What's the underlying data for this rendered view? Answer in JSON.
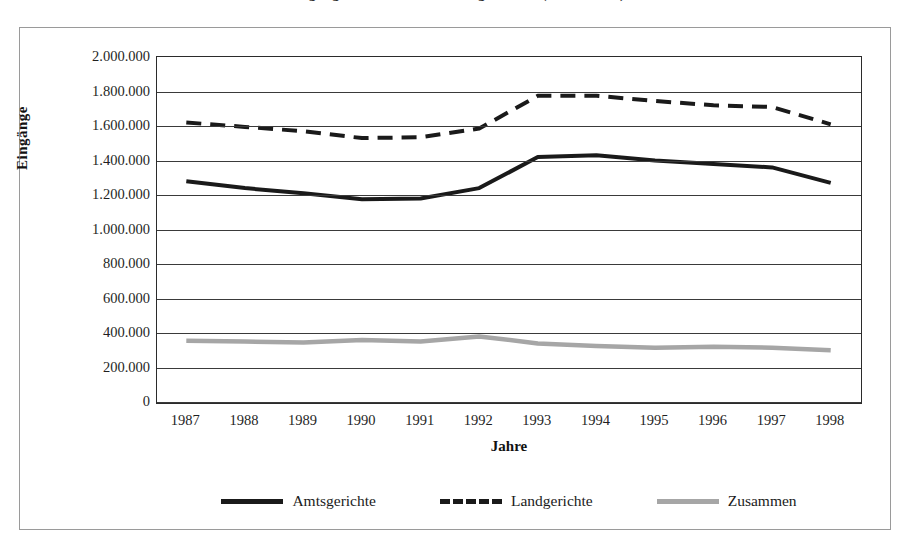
{
  "title": {
    "text": "Eingänge bei Amts- und Landgerichten (Zivilsachen)"
  },
  "axes": {
    "y_title": "Eingänge",
    "x_title": "Jahre",
    "y_ticks": [
      "2.000.000",
      "1.800.000",
      "1.600.000",
      "1.400.000",
      "1.200.000",
      "1.000.000",
      "800.000",
      "600.000",
      "400.000",
      "200.000",
      "0"
    ]
  },
  "legend": {
    "position": "bottom",
    "items": [
      {
        "label": "Amtsgerichte",
        "color": "#1a1a1a",
        "style": "solid"
      },
      {
        "label": "Landgerichte",
        "color": "#1a1a1a",
        "style": "dashed"
      },
      {
        "label": "Zusammen",
        "color": "#a6a6a6",
        "style": "solid"
      }
    ]
  },
  "colors": {
    "amtsgerichte": "#1a1a1a",
    "landgerichte": "#1a1a1a",
    "zusammen": "#a6a6a6",
    "grid": "#3a3a3a",
    "frame": "#9a9a9a"
  },
  "chart_data": {
    "type": "line",
    "title": "Eingänge bei Amts- und Landgerichten (Zivilsachen)",
    "xlabel": "Jahre",
    "ylabel": "Eingänge",
    "ylim": [
      0,
      2000000
    ],
    "ytick_step": 200000,
    "grid": true,
    "legend_position": "bottom",
    "categories": [
      "1987",
      "1988",
      "1989",
      "1990",
      "1991",
      "1992",
      "1993",
      "1994",
      "1995",
      "1996",
      "1997",
      "1998"
    ],
    "series": [
      {
        "name": "Amtsgerichte",
        "color": "#1a1a1a",
        "style": "solid",
        "values": [
          1280000,
          1240000,
          1210000,
          1175000,
          1180000,
          1240000,
          1420000,
          1430000,
          1400000,
          1380000,
          1360000,
          1270000
        ]
      },
      {
        "name": "Landgerichte",
        "color": "#1a1a1a",
        "style": "dashed",
        "values": [
          1620000,
          1595000,
          1570000,
          1530000,
          1535000,
          1585000,
          1775000,
          1775000,
          1745000,
          1720000,
          1710000,
          1610000
        ]
      },
      {
        "name": "Zusammen",
        "color": "#a6a6a6",
        "style": "solid",
        "values": [
          355000,
          350000,
          345000,
          360000,
          350000,
          380000,
          340000,
          325000,
          315000,
          320000,
          315000,
          300000
        ]
      }
    ]
  }
}
